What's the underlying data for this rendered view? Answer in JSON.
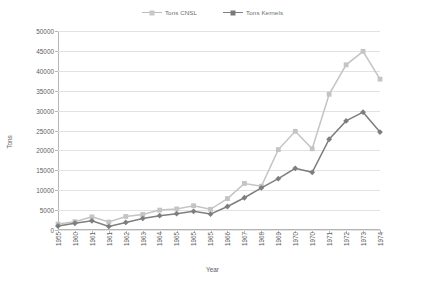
{
  "chart_data": {
    "type": "line",
    "title": "",
    "xlabel": "Year",
    "ylabel": "Tons",
    "ylim": [
      0,
      50000
    ],
    "ytick_step": 5000,
    "yticks": [
      "0",
      "5000",
      "10000",
      "15000",
      "20000",
      "25000",
      "30000",
      "35000",
      "40000",
      "45000",
      "50000"
    ],
    "grid": true,
    "legend_position": "top-center",
    "categories": [
      "1955",
      "1960",
      "1961",
      "1961",
      "1962",
      "1963",
      "1964",
      "1965",
      "1965",
      "1965",
      "1966",
      "1967",
      "1968",
      "1969",
      "1970",
      "1970",
      "1971",
      "1972",
      "1973",
      "1974"
    ],
    "series": [
      {
        "name": "Tons CNSL",
        "color": "#c4c4c4",
        "marker": "square",
        "values": [
          1500,
          2100,
          3300,
          2000,
          3400,
          3900,
          5000,
          5300,
          6100,
          5200,
          7900,
          11700,
          11000,
          20200,
          24800,
          20400,
          34100,
          41500,
          44900,
          37900
        ]
      },
      {
        "name": "Tons Kernels",
        "color": "#7e7e7e",
        "marker": "diamond",
        "values": [
          1000,
          1700,
          2300,
          900,
          1900,
          2900,
          3600,
          4100,
          4700,
          4000,
          5900,
          8100,
          10600,
          12900,
          15500,
          14500,
          22800,
          27400,
          29600,
          24600
        ]
      }
    ]
  },
  "legend": {
    "entries": [
      {
        "label": "Tons CNSL"
      },
      {
        "label": "Tons Kernels"
      }
    ]
  },
  "axes": {
    "x_title": "Year",
    "y_title": "Tons"
  },
  "colors": {
    "series_cnsl": "#c4c4c4",
    "series_kernels": "#7e7e7e",
    "grid": "#e2e2e2",
    "axis": "#b5b5b5",
    "text": "#5e5e5e",
    "background": "#ffffff"
  }
}
